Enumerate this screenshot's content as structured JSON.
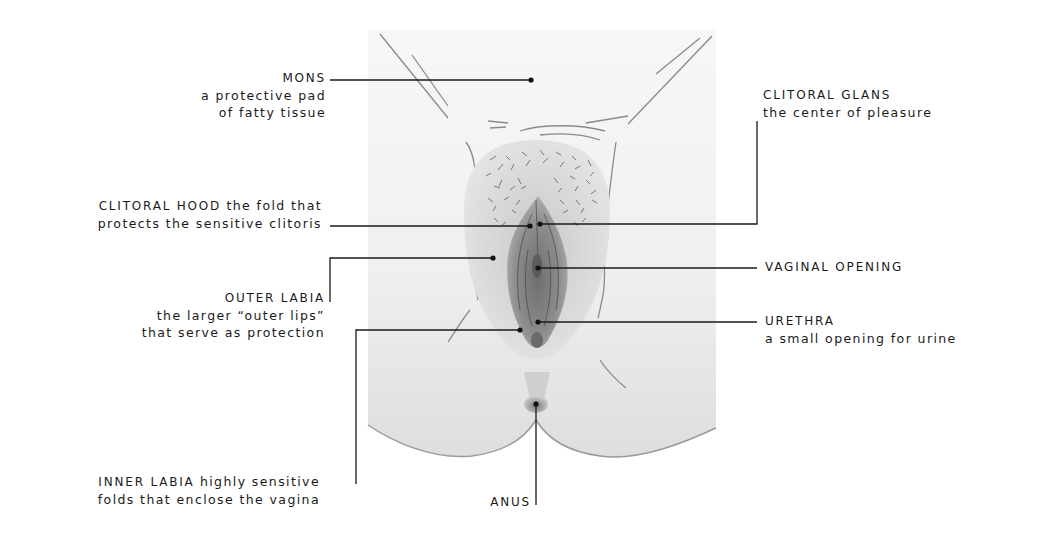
{
  "diagram": {
    "colors": {
      "line": "#1a1a1a",
      "panel": "#eeeeee",
      "skin_dark": "#7a7a7a",
      "background": "#ffffff"
    },
    "labels": {
      "mons": {
        "title": "MONS",
        "desc_1": "a protective pad",
        "desc_2": "of fatty tissue"
      },
      "clitoral_glans": {
        "title": "CLITORAL GLANS",
        "desc_1": "the center of pleasure"
      },
      "clitoral_hood": {
        "title": "CLITORAL HOOD",
        "title_suffix": " the fold that",
        "desc_1": "protects the sensitive clitoris"
      },
      "vaginal_opening": {
        "title": "VAGINAL OPENING"
      },
      "outer_labia": {
        "title": "OUTER LABIA",
        "desc_1": "the larger “outer lips”",
        "desc_2": "that serve as protection"
      },
      "urethra": {
        "title": "URETHRA",
        "desc_1": "a small opening for urine"
      },
      "inner_labia": {
        "title": "INNER LABIA",
        "title_suffix": " highly sensitive",
        "desc_1": "folds that enclose the vagina"
      },
      "anus": {
        "title": "ANUS"
      }
    }
  }
}
